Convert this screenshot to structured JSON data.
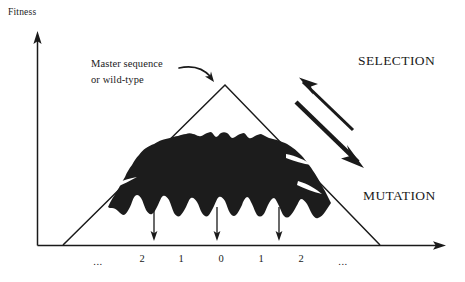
{
  "figure": {
    "title_axis_y": "Fitness",
    "annotation": {
      "line1": "Master sequence",
      "line2": "or wild-type"
    },
    "process_labels": {
      "selection": "SELECTION",
      "mutation": "MUTATION"
    },
    "x_ticks": [
      {
        "label": "...",
        "x": 98
      },
      {
        "label": "2",
        "x": 142
      },
      {
        "label": "1",
        "x": 181
      },
      {
        "label": "0",
        "x": 221
      },
      {
        "label": "1",
        "x": 261
      },
      {
        "label": "2",
        "x": 301
      },
      {
        "label": "...",
        "x": 343
      }
    ],
    "colors": {
      "ink": "#1a1a1a",
      "cloud_fill": "#1c1c1c",
      "background": "#ffffff"
    }
  },
  "chart_data": {
    "type": "area",
    "title": "",
    "xlabel": "",
    "ylabel": "Fitness",
    "grid": false,
    "legend": null,
    "categories": [
      "...",
      "2",
      "1",
      "0",
      "1",
      "2",
      "..."
    ],
    "x_tick_values": [
      null,
      -2,
      -1,
      0,
      1,
      2,
      null
    ],
    "annotations": [
      {
        "text": "Master sequence or wild-type",
        "points_to": "peak of fitness landscape at x = 0"
      },
      {
        "text": "SELECTION",
        "direction": "up-left arrow toward the peak"
      },
      {
        "text": "MUTATION",
        "direction": "down-right arrow away from the peak"
      },
      {
        "text": "downward arrows",
        "count": 3,
        "at_x": [
          -2,
          0,
          2
        ]
      }
    ],
    "series": [
      {
        "name": "Fitness landscape (single-peak / triangular)",
        "type": "line",
        "x": [
          -4.0,
          0.0,
          4.0
        ],
        "values": [
          0.0,
          1.0,
          0.0
        ]
      },
      {
        "name": "Quasispecies mutant cloud (population distribution)",
        "type": "area",
        "x": [
          -3.1,
          -2.9,
          -2.7,
          -2.5,
          -2.3,
          -2.1,
          -1.9,
          -1.7,
          -1.5,
          -1.3,
          -1.1,
          -0.9,
          -0.7,
          -0.5,
          -0.3,
          -0.1,
          0.1,
          0.3,
          0.5,
          0.7,
          0.9,
          1.1,
          1.3,
          1.5,
          1.7,
          1.9,
          2.1,
          2.3,
          2.5,
          2.7,
          2.9,
          3.1
        ],
        "upper": [
          0.24,
          0.33,
          0.42,
          0.5,
          0.56,
          0.6,
          0.63,
          0.66,
          0.68,
          0.7,
          0.72,
          0.73,
          0.71,
          0.74,
          0.72,
          0.73,
          0.7,
          0.73,
          0.71,
          0.68,
          0.7,
          0.66,
          0.63,
          0.65,
          0.6,
          0.57,
          0.52,
          0.47,
          0.41,
          0.35,
          0.29,
          0.22
        ],
        "lower": [
          0.22,
          0.2,
          0.17,
          0.14,
          0.12,
          0.1,
          0.16,
          0.22,
          0.13,
          0.09,
          0.18,
          0.24,
          0.15,
          0.08,
          0.17,
          0.23,
          0.14,
          0.09,
          0.19,
          0.25,
          0.16,
          0.1,
          0.2,
          0.26,
          0.15,
          0.09,
          0.18,
          0.22,
          0.16,
          0.12,
          0.17,
          0.2
        ]
      }
    ],
    "xlim": [
      -4.6,
      5.4
    ],
    "ylim": [
      0,
      1.15
    ]
  }
}
